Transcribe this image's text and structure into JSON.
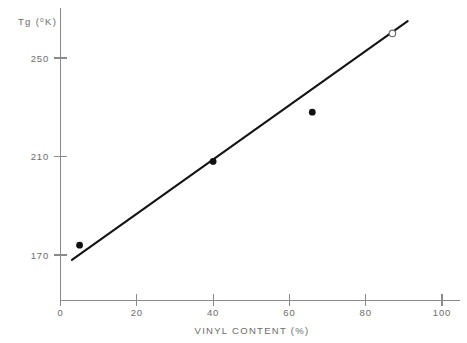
{
  "chart_data": {
    "type": "scatter",
    "title": "",
    "xlabel": "VINYL CONTENT (%)",
    "ylabel": "Tg (°K)",
    "ylabel_base": "Tg (",
    "ylabel_sup": "o",
    "ylabel_tail": "K)",
    "xlim": [
      0,
      100
    ],
    "ylim": [
      147,
      270
    ],
    "xticks": [
      0,
      20,
      40,
      60,
      80,
      100
    ],
    "xtick_labels": [
      "0",
      "20",
      "40",
      "60",
      "80",
      "100"
    ],
    "yticks": [
      170,
      210,
      250
    ],
    "ytick_labels": [
      "170",
      "210",
      "250"
    ],
    "grid": false,
    "legend": null,
    "series": [
      {
        "name": "measured",
        "marker": "filled-circle",
        "color": "#111111",
        "points": [
          {
            "x": 5,
            "y": 174
          },
          {
            "x": 40,
            "y": 208
          },
          {
            "x": 66,
            "y": 228
          }
        ]
      },
      {
        "name": "extrapolated",
        "marker": "open-circle",
        "color": "#6f6f6f",
        "points": [
          {
            "x": 87,
            "y": 260
          }
        ]
      }
    ],
    "fit_line": {
      "name": "linear-fit",
      "color": "#151515",
      "x_start": 3,
      "y_start": 168,
      "x_end": 91,
      "y_end": 265
    }
  }
}
